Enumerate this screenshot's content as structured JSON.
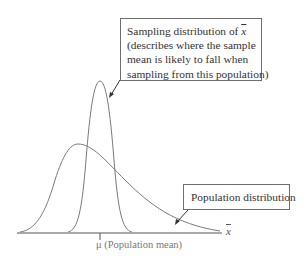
{
  "diagram": {
    "sampling_box": {
      "lines": [
        "Sampling distribution of ",
        "(describes where the sample",
        "mean is likely to fall when",
        "sampling from this population)"
      ],
      "xbar_symbol": "x"
    },
    "population_box": {
      "label": "Population distribution"
    },
    "axis": {
      "label": "x",
      "tick_label": "μ (Population mean)"
    },
    "colors": {
      "curve": "#7a7a7a",
      "axis": "#555555",
      "box_border": "#6d6d6d",
      "text": "#333333"
    }
  }
}
